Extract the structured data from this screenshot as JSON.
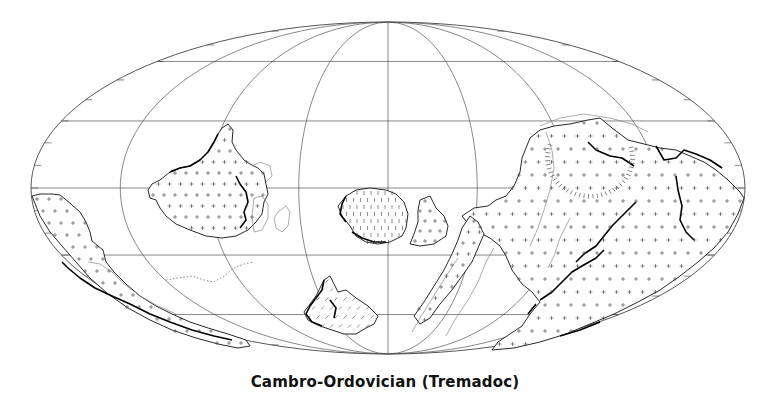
{
  "figure": {
    "caption": "Cambro-Ordovician (Tremadoc)",
    "projection": "Mollweide (equal-area, elliptical)",
    "background_color": "#ffffff",
    "line_color": "#111111"
  },
  "map_frame": {
    "center_x": 388,
    "center_y": 188,
    "half_width": 357,
    "half_height": 166,
    "meridians_deg": [
      -135,
      -90,
      -45,
      0,
      45,
      90,
      135
    ],
    "parallels_deg": [
      -60,
      -30,
      0,
      30,
      60
    ],
    "border_tick_spacing_deg": 10
  },
  "features": {
    "landmasses": [
      {
        "name": "Laurentia",
        "location": "left-centre, straddling equator",
        "fill_symbol": "crosses"
      },
      {
        "name": "Baltica",
        "location": "centre, south of equator",
        "fill_symbol": "dashes"
      },
      {
        "name": "Siberia",
        "location": "centre-right, small block south of equator",
        "fill_symbol": "crosses"
      },
      {
        "name": "Gondwana",
        "location": "right half, large mass spanning hemispheres",
        "fill_symbol": "crosses"
      },
      {
        "name": "Western margin fragment",
        "location": "far left, wrapping into southern hemisphere",
        "fill_symbol": "crosses"
      },
      {
        "name": "Southern block",
        "location": "lower centre, south of 30S",
        "fill_symbol": "dashes"
      }
    ],
    "polar_ring": {
      "location": "upper right, within Gondwana",
      "style": "radial tick ring"
    },
    "dotted_trench": {
      "location": "south of Laurentia",
      "style": "dotted line"
    }
  }
}
